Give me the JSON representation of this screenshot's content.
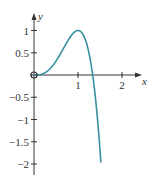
{
  "chart_data": {
    "type": "line",
    "title": "",
    "xlabel": "x",
    "ylabel": "y",
    "xlim": [
      0,
      2.3
    ],
    "ylim": [
      -2.1,
      1.2
    ],
    "grid": false,
    "legend": null,
    "x_ticks": [
      "1",
      "2"
    ],
    "y_ticks": [
      "1",
      "0.5",
      "−0.5",
      "−1",
      "−1.5",
      "−2"
    ],
    "series": [
      {
        "name": "curve",
        "function": "y = 4x^3 - 3x^4",
        "color": "#3a8fa0",
        "x": [
          0,
          0.25,
          0.5,
          0.75,
          1.0,
          1.1,
          1.2,
          1.333,
          1.4,
          1.45,
          1.52
        ],
        "values": [
          0,
          0.05,
          0.31,
          0.7,
          1.0,
          0.93,
          0.69,
          0.0,
          -0.38,
          -0.76,
          -2.0
        ]
      }
    ],
    "annotations": [
      {
        "type": "open-circle",
        "x": 0,
        "y": 0
      }
    ]
  },
  "colors": {
    "curve": "#3a8fa0",
    "axis": "#333333"
  }
}
